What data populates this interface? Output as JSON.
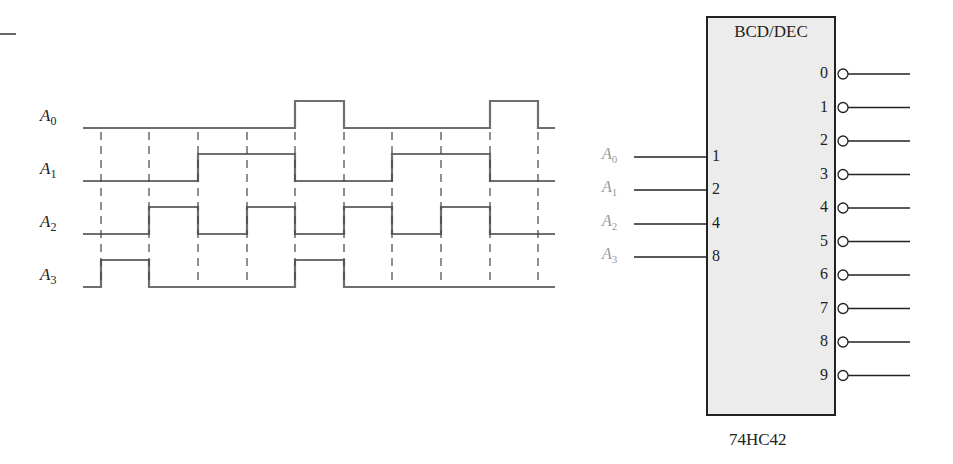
{
  "waveforms": {
    "x_start": 83,
    "x_end": 555,
    "transition_x": [
      101,
      149,
      198,
      247,
      295,
      344,
      392,
      441,
      490,
      538
    ],
    "signals": [
      {
        "name": "A",
        "sub": "0",
        "low_y": 128,
        "high_y": 101,
        "high_intervals": [
          [
            295,
            344
          ],
          [
            490,
            538
          ]
        ]
      },
      {
        "name": "A",
        "sub": "1",
        "low_y": 181,
        "high_y": 154,
        "high_intervals": [
          [
            198,
            295
          ],
          [
            392,
            490
          ]
        ]
      },
      {
        "name": "A",
        "sub": "2",
        "low_y": 234,
        "high_y": 207,
        "high_intervals": [
          [
            149,
            198
          ],
          [
            247,
            295
          ],
          [
            344,
            392
          ],
          [
            441,
            490
          ]
        ]
      },
      {
        "name": "A",
        "sub": "3",
        "low_y": 287,
        "high_y": 260,
        "high_intervals": [
          [
            101,
            149
          ],
          [
            295,
            344
          ]
        ]
      }
    ]
  },
  "decoder": {
    "title": "BCD/DEC",
    "part_number": "74HC42",
    "inputs": [
      {
        "label": "A",
        "sub": "0",
        "pin": "1"
      },
      {
        "label": "A",
        "sub": "1",
        "pin": "2"
      },
      {
        "label": "A",
        "sub": "2",
        "pin": "4"
      },
      {
        "label": "A",
        "sub": "3",
        "pin": "8"
      }
    ],
    "outputs": [
      "0",
      "1",
      "2",
      "3",
      "4",
      "5",
      "6",
      "7",
      "8",
      "9"
    ],
    "outputs_active_low": true
  },
  "colors": {
    "waveform": "#6e6e6e",
    "chip_fill": "#ececec",
    "chip_border": "#222222",
    "input_label": "#9a9a9a"
  }
}
